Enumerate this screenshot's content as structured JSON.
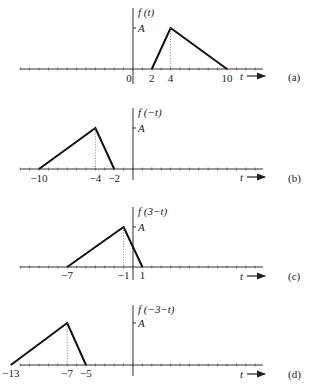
{
  "chart_data": [
    {
      "type": "line",
      "panel": "(a)",
      "title": "f(t)",
      "ylabel": "f(t)",
      "xlabel": "t",
      "ytick_label": "A",
      "x": [
        2,
        4,
        10
      ],
      "y": [
        0,
        1,
        0
      ],
      "x_tick_labels": [
        "0",
        "2",
        "4",
        "10"
      ],
      "x_tick_values": [
        0,
        2,
        4,
        10
      ],
      "peak_dashed_at": 4
    },
    {
      "type": "line",
      "panel": "(b)",
      "title": "f(-t)",
      "ylabel": "f(−t)",
      "xlabel": "t",
      "ytick_label": "A",
      "x": [
        -10,
        -4,
        -2
      ],
      "y": [
        0,
        1,
        0
      ],
      "x_tick_labels": [
        "−10",
        "−4",
        "−2"
      ],
      "x_tick_values": [
        -10,
        -4,
        -2
      ],
      "peak_dashed_at": -4
    },
    {
      "type": "line",
      "panel": "(c)",
      "title": "f(3-t)",
      "ylabel": "f(3−t)",
      "xlabel": "t",
      "ytick_label": "A",
      "x": [
        -7,
        -1,
        1
      ],
      "y": [
        0,
        1,
        0
      ],
      "x_tick_labels": [
        "−7",
        "−1",
        "1"
      ],
      "x_tick_values": [
        -7,
        -1,
        1
      ],
      "peak_dashed_at": -1
    },
    {
      "type": "line",
      "panel": "(d)",
      "title": "f(-3-t)",
      "ylabel": "f(−3−t)",
      "xlabel": "t",
      "ytick_label": "A",
      "x": [
        -13,
        -7,
        -5
      ],
      "y": [
        0,
        1,
        0
      ],
      "x_tick_labels": [
        "−13",
        "−7",
        "−5"
      ],
      "x_tick_values": [
        -13,
        -7,
        -5
      ],
      "peak_dashed_at": -7
    }
  ],
  "panels": [
    {
      "id": "a",
      "tag": "(a)",
      "ylabel": "f (t)",
      "amp": "A",
      "tvar": "t",
      "ticks": [
        {
          "v": 0,
          "l": "0"
        },
        {
          "v": 2,
          "l": "2"
        },
        {
          "v": 4,
          "l": "4"
        },
        {
          "v": 10,
          "l": "10"
        }
      ],
      "pts": [
        2,
        4,
        10
      ],
      "peak": 4
    },
    {
      "id": "b",
      "tag": "(b)",
      "ylabel": "f (−t)",
      "amp": "A",
      "tvar": "t",
      "ticks": [
        {
          "v": -10,
          "l": "−10"
        },
        {
          "v": -4,
          "l": "−4"
        },
        {
          "v": -2,
          "l": "−2"
        }
      ],
      "pts": [
        -10,
        -4,
        -2
      ],
      "peak": -4
    },
    {
      "id": "c",
      "tag": "(c)",
      "ylabel": "f (3−t)",
      "amp": "A",
      "tvar": "t",
      "ticks": [
        {
          "v": -7,
          "l": "−7"
        },
        {
          "v": -1,
          "l": "−1"
        },
        {
          "v": 1,
          "l": "1"
        }
      ],
      "pts": [
        -7,
        -1,
        1
      ],
      "peak": -1
    },
    {
      "id": "d",
      "tag": "(d)",
      "ylabel": "f (−3−t)",
      "amp": "A",
      "tvar": "t",
      "ticks": [
        {
          "v": -13,
          "l": "−13"
        },
        {
          "v": -7,
          "l": "−7"
        },
        {
          "v": -5,
          "l": "−5"
        }
      ],
      "pts": [
        -13,
        -7,
        -5
      ],
      "peak": -7
    }
  ]
}
